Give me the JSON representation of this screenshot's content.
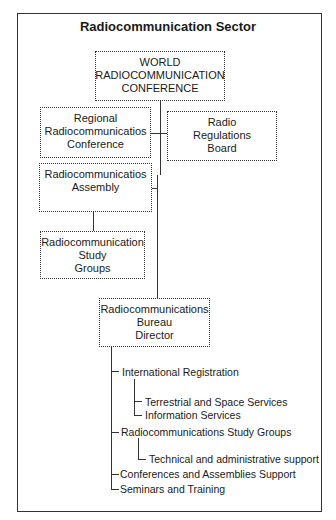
{
  "title": "Radiocommunication Sector",
  "boxes": {
    "wrc": [
      "WORLD",
      "RADIOCOMMUNICATION",
      "CONFERENCE"
    ],
    "regional": [
      "Regional",
      "Radiocommunicatios",
      "Conference"
    ],
    "rrb": [
      "Radio",
      "Regulations",
      "Board"
    ],
    "assembly": [
      "Radiocommunicatios",
      "Assembly"
    ],
    "study_groups": [
      "Radiocommunication",
      "Study",
      "Groups"
    ],
    "bureau": [
      "Radiocommunications",
      "Bureau",
      "Director"
    ]
  },
  "bureau_tree": [
    {
      "label": "International Registration",
      "level": 1
    },
    {
      "label": "Terrestrial and Space Services",
      "level": 2
    },
    {
      "label": "Information Services",
      "level": 2
    },
    {
      "label": "Radiocommunications Study Groups",
      "level": 1
    },
    {
      "label": "Technical and administrative support",
      "level": 2
    },
    {
      "label": "Conferences and Assemblies Support",
      "level": 1
    },
    {
      "label": "Seminars and Training",
      "level": 1
    }
  ]
}
